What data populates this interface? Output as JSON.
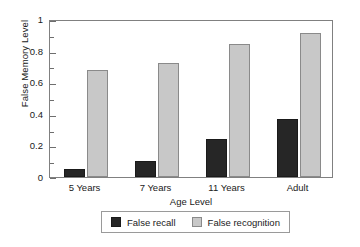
{
  "chart_data": {
    "type": "bar",
    "title": "",
    "xlabel": "Age Level",
    "ylabel": "False Memory Level",
    "categories": [
      "5 Years",
      "7 Years",
      "11 Years",
      "Adult"
    ],
    "series": [
      {
        "name": "False recall",
        "values": [
          0.05,
          0.1,
          0.24,
          0.37
        ],
        "color": "#262626"
      },
      {
        "name": "False recognition",
        "values": [
          0.68,
          0.72,
          0.84,
          0.91
        ],
        "color": "#c8c8c8"
      }
    ],
    "ylim": [
      0,
      1
    ],
    "yticks": [
      "0",
      "0.2",
      "0.4",
      "0.6",
      "0.8",
      "1"
    ],
    "ytick_values": [
      0,
      0.2,
      0.4,
      0.6,
      0.8,
      1
    ],
    "yminor_ticks": [
      0.1,
      0.3,
      0.5,
      0.7,
      0.9
    ],
    "grid": false,
    "legend_position": "bottom"
  },
  "legend": {
    "items": [
      {
        "label": "False recall"
      },
      {
        "label": "False recognition"
      }
    ]
  }
}
